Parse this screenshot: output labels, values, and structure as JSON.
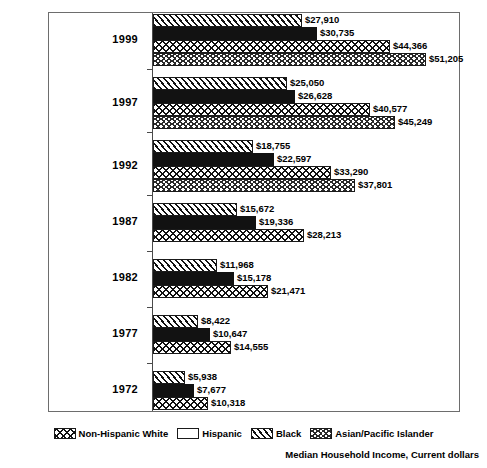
{
  "chart_data": {
    "type": "bar",
    "orientation": "horizontal",
    "title": "",
    "annotation": "Median Household Income, Current dollars",
    "xlabel": "",
    "ylabel": "",
    "grid": false,
    "legend_position": "bottom",
    "axis_max": 56000,
    "categories": [
      "1999",
      "1997",
      "1992",
      "1987",
      "1982",
      "1977",
      "1972"
    ],
    "series_order_in_group": [
      "Black",
      "Hispanic",
      "Non-Hispanic White",
      "Asian/Pacific Islander"
    ],
    "series": [
      {
        "name": "Black",
        "pattern": "diagonal-hatch",
        "values": [
          27910,
          25050,
          18755,
          15672,
          11968,
          8422,
          5938
        ],
        "labels": [
          "$27,910",
          "$25,050",
          "$18,755",
          "$15,672",
          "$11,968",
          "$8,422",
          "$5,938"
        ]
      },
      {
        "name": "Hispanic",
        "pattern": "solid-black",
        "values": [
          30735,
          26628,
          22597,
          19336,
          15178,
          10647,
          7677
        ],
        "labels": [
          "$30,735",
          "$26,628",
          "$22,597",
          "$19,336",
          "$15,178",
          "$10,647",
          "$7,677"
        ]
      },
      {
        "name": "Non-Hispanic White",
        "pattern": "zigzag-wave",
        "values": [
          44366,
          40577,
          33290,
          28213,
          21471,
          14555,
          10318
        ],
        "labels": [
          "$44,366",
          "$40,577",
          "$33,290",
          "$28,213",
          "$21,471",
          "$14,555",
          "$10,318"
        ]
      },
      {
        "name": "Asian/Pacific Islander",
        "pattern": "caret-dots",
        "values": [
          51205,
          45249,
          37801,
          null,
          null,
          null,
          null
        ],
        "labels": [
          "$51,205",
          "$45,249",
          "$37,801",
          "",
          "",
          "",
          ""
        ]
      }
    ],
    "groups": [
      {
        "year": "1999",
        "bars": [
          {
            "series": "Black",
            "value": 27910,
            "label": "$27,910"
          },
          {
            "series": "Hispanic",
            "value": 30735,
            "label": "$30,735"
          },
          {
            "series": "Non-Hispanic White",
            "value": 44366,
            "label": "$44,366"
          },
          {
            "series": "Asian/Pacific Islander",
            "value": 51205,
            "label": "$51,205"
          }
        ]
      },
      {
        "year": "1997",
        "bars": [
          {
            "series": "Black",
            "value": 25050,
            "label": "$25,050"
          },
          {
            "series": "Hispanic",
            "value": 26628,
            "label": "$26,628"
          },
          {
            "series": "Non-Hispanic White",
            "value": 40577,
            "label": "$40,577"
          },
          {
            "series": "Asian/Pacific Islander",
            "value": 45249,
            "label": "$45,249"
          }
        ]
      },
      {
        "year": "1992",
        "bars": [
          {
            "series": "Black",
            "value": 18755,
            "label": "$18,755"
          },
          {
            "series": "Hispanic",
            "value": 22597,
            "label": "$22,597"
          },
          {
            "series": "Non-Hispanic White",
            "value": 33290,
            "label": "$33,290"
          },
          {
            "series": "Asian/Pacific Islander",
            "value": 37801,
            "label": "$37,801"
          }
        ]
      },
      {
        "year": "1987",
        "bars": [
          {
            "series": "Black",
            "value": 15672,
            "label": "$15,672"
          },
          {
            "series": "Hispanic",
            "value": 19336,
            "label": "$19,336"
          },
          {
            "series": "Non-Hispanic White",
            "value": 28213,
            "label": "$28,213"
          }
        ]
      },
      {
        "year": "1982",
        "bars": [
          {
            "series": "Black",
            "value": 11968,
            "label": "$11,968"
          },
          {
            "series": "Hispanic",
            "value": 15178,
            "label": "$15,178"
          },
          {
            "series": "Non-Hispanic White",
            "value": 21471,
            "label": "$21,471"
          }
        ]
      },
      {
        "year": "1977",
        "bars": [
          {
            "series": "Black",
            "value": 8422,
            "label": "$8,422"
          },
          {
            "series": "Hispanic",
            "value": 10647,
            "label": "$10,647"
          },
          {
            "series": "Non-Hispanic White",
            "value": 14555,
            "label": "$14,555"
          }
        ]
      },
      {
        "year": "1972",
        "bars": [
          {
            "series": "Black",
            "value": 5938,
            "label": "$5,938"
          },
          {
            "series": "Hispanic",
            "value": 7677,
            "label": "$7,677"
          },
          {
            "series": "Non-Hispanic White",
            "value": 10318,
            "label": "$10,318"
          }
        ]
      }
    ],
    "legend": [
      {
        "label": "Non-Hispanic White",
        "pattern": "zigzag-wave"
      },
      {
        "label": "Hispanic",
        "pattern": "solid-black"
      },
      {
        "label": "Black",
        "pattern": "diagonal-hatch"
      },
      {
        "label": "Asian/Pacific Islander",
        "pattern": "caret-dots"
      }
    ],
    "colors": {
      "bar_outline": "#1a1a1a",
      "solid_fill": "#121212",
      "frame": "#6d6d6d",
      "axis": "#4a4a4a",
      "text": "#000000",
      "background": "#ffffff"
    }
  }
}
